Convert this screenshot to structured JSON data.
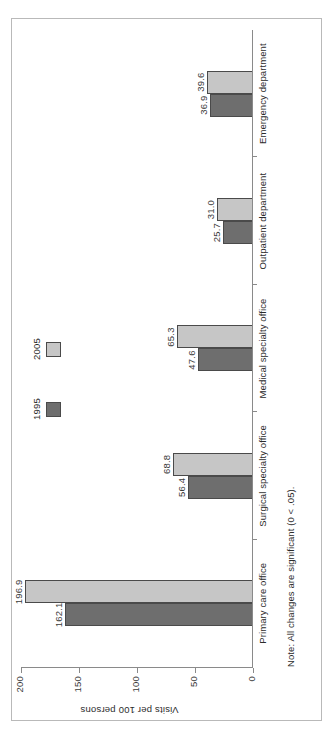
{
  "chart_data": {
    "type": "bar",
    "orientation": "vertical",
    "title": "",
    "xlabel": "",
    "ylabel": "Visits per 100 persons",
    "ylim": [
      0,
      200
    ],
    "yticks": [
      "200",
      "150",
      "100",
      "50",
      "0"
    ],
    "ytick_values": [
      200,
      150,
      100,
      50,
      0
    ],
    "grid": false,
    "legend_position": "top-right",
    "categories": [
      "Primary care office",
      "Surgical specialty office",
      "Medical specialty office",
      "Outpatient department",
      "Emergency department"
    ],
    "series": [
      {
        "name": "1995",
        "color": "#6e6e6e",
        "values": [
          162.1,
          56.4,
          47.6,
          25.7,
          36.9
        ],
        "labels": [
          "162.1",
          "56.4",
          "47.6",
          "25.7",
          "36.9"
        ]
      },
      {
        "name": "2005",
        "color": "#c6c6c6",
        "values": [
          196.9,
          68.8,
          65.3,
          31.0,
          39.6
        ],
        "labels": [
          "196.9",
          "68.8",
          "65.3",
          "31.0",
          "39.6"
        ]
      }
    ],
    "note": "Note: All changes are significant (0 < .05)."
  },
  "legend": {
    "items": [
      {
        "label": "1995",
        "color": "#6e6e6e"
      },
      {
        "label": "2005",
        "color": "#c6c6c6"
      }
    ]
  }
}
